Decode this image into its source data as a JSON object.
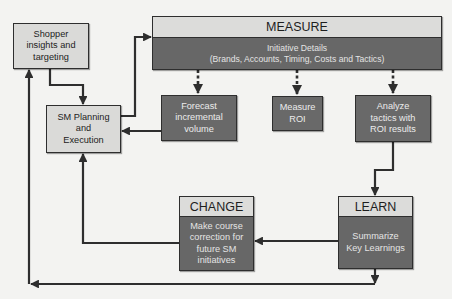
{
  "diagram": {
    "nodes": {
      "shopper": {
        "label": "Shopper\ninsights and\ntargeting"
      },
      "planning": {
        "label": "SM Planning\nand\nExecution"
      },
      "measure": {
        "title": "MEASURE",
        "body": "Initiative Details\n(Brands, Accounts, Timing, Costs and Tactics)"
      },
      "forecast": {
        "label": "Forecast\nincremental\nvolume"
      },
      "roi": {
        "label": "Measure\nROI"
      },
      "analyze": {
        "label": "Analyze\ntactics with\nROI results"
      },
      "learn": {
        "title": "LEARN",
        "body": "Summarize\nKey Learnings"
      },
      "change": {
        "title": "CHANGE",
        "body": "Make course\ncorrection for\nfuture SM\ninitiatives"
      }
    },
    "edges": [
      {
        "from": "shopper",
        "to": "planning",
        "style": "solid"
      },
      {
        "from": "planning",
        "to": "measure",
        "style": "solid"
      },
      {
        "from": "measure",
        "to": "forecast",
        "style": "dashed"
      },
      {
        "from": "measure",
        "to": "roi",
        "style": "dashed"
      },
      {
        "from": "measure",
        "to": "analyze",
        "style": "dashed"
      },
      {
        "from": "forecast",
        "to": "planning",
        "style": "solid"
      },
      {
        "from": "analyze",
        "to": "learn",
        "style": "solid"
      },
      {
        "from": "learn",
        "to": "change",
        "style": "solid"
      },
      {
        "from": "change",
        "to": "planning",
        "style": "solid"
      },
      {
        "from": "learn",
        "to": "shopper",
        "style": "solid"
      }
    ],
    "colors": {
      "line": "#2e2e2e",
      "light_fill": "#dadad8",
      "dark_fill": "#696969",
      "background": "#f3f3f1"
    }
  }
}
